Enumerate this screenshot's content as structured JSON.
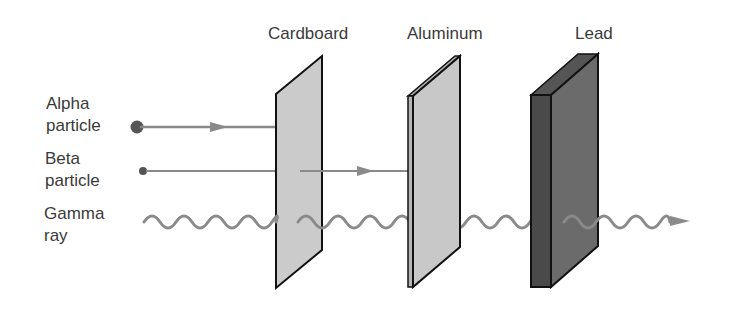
{
  "diagram": {
    "materials": [
      {
        "name": "Cardboard",
        "fill": "#c9c9c9"
      },
      {
        "name": "Aluminum",
        "fill": "#c6c6c6"
      },
      {
        "name": "Lead",
        "fill": "#6a6a6a"
      }
    ],
    "particles": [
      {
        "line1": "Alpha",
        "line2": "particle",
        "stopped_by": "Cardboard"
      },
      {
        "line1": "Beta",
        "line2": "particle",
        "stopped_by": "Aluminum"
      },
      {
        "line1": "Gamma",
        "line2": "ray",
        "stopped_by": "none (passes through lead)"
      }
    ],
    "colors": {
      "text": "#3a3a3a",
      "ray": "#8a8a8a",
      "particle_dot": "#555555",
      "outline": "#111111"
    }
  }
}
